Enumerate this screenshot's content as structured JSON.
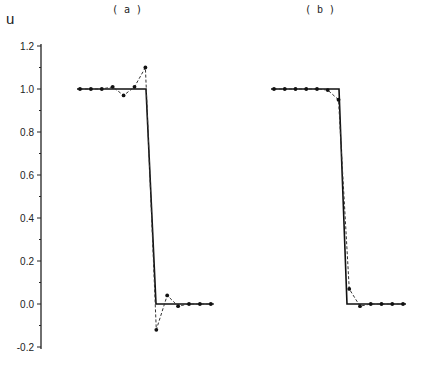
{
  "chart_data": {
    "type": "line",
    "ylabel": "u",
    "ylim": [
      -0.2,
      1.2
    ],
    "yticks": [
      "1.2",
      "1.0",
      "0.8",
      "0.6",
      "0.4",
      "0.2",
      "0.0",
      "-0.2"
    ],
    "grid": false,
    "legend": null,
    "panels": [
      {
        "title": "( a )",
        "exact": [
          [
            0,
            1.0
          ],
          [
            6.1,
            1.0
          ],
          [
            7.0,
            0.0
          ],
          [
            12,
            0.0
          ]
        ],
        "series": [
          {
            "name": "numerical",
            "style": "dashed-with-markers",
            "x": [
              0,
              1,
              2,
              3,
              4,
              5,
              6,
              7,
              8,
              9,
              10,
              11,
              12
            ],
            "values": [
              1.0,
              1.0,
              1.0,
              1.01,
              0.97,
              1.01,
              1.1,
              -0.12,
              0.04,
              -0.01,
              0.0,
              0.0,
              0.0
            ]
          }
        ]
      },
      {
        "title": "( b )",
        "exact": [
          [
            0,
            1.0
          ],
          [
            6.1,
            1.0
          ],
          [
            6.8,
            0.0
          ],
          [
            12,
            0.0
          ]
        ],
        "series": [
          {
            "name": "numerical",
            "style": "dashed-with-markers",
            "x": [
              0,
              1,
              2,
              3,
              4,
              5,
              6,
              7,
              8,
              9,
              10,
              11,
              12
            ],
            "values": [
              1.0,
              1.0,
              1.0,
              1.0,
              1.0,
              0.995,
              0.95,
              0.07,
              -0.01,
              0.0,
              0.0,
              0.0,
              0.0
            ]
          }
        ]
      }
    ]
  }
}
